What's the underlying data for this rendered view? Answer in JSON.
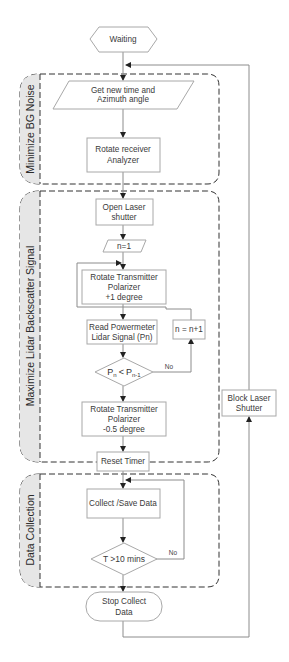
{
  "diagram": {
    "type": "flowchart",
    "colors": {
      "line": "#9a9a9a",
      "box_border": "#a8a8a8",
      "group_border": "#333333",
      "group_tab": "#e6e6e6",
      "text": "#333333"
    },
    "groups": [
      {
        "id": "bg-noise",
        "label": "Minimize BG Noise"
      },
      {
        "id": "lidar",
        "label": "Maximize Lidar Backscatter Signal"
      },
      {
        "id": "data",
        "label": "Data Collection"
      }
    ],
    "nodes": {
      "waiting": {
        "shape": "hexagon",
        "label": "Waiting"
      },
      "get_time": {
        "shape": "parallelogram",
        "line1": "Get new time and",
        "line2": "Azimuth angle"
      },
      "rotate_receiver": {
        "shape": "rectangle",
        "line1": "Rotate receiver",
        "line2": "Analyzer"
      },
      "open_laser": {
        "shape": "rectangle",
        "line1": "Open Laser",
        "line2": "shutter"
      },
      "n_init": {
        "shape": "parallelogram",
        "label": "n=1"
      },
      "rotate_tx_plus": {
        "shape": "rectangle",
        "line1": "Rotate Transmitter",
        "line2": "Polarizer",
        "line3": "+1 degree"
      },
      "read_power": {
        "shape": "rectangle",
        "line1": "Read Powermeter",
        "line2": "Lidar Signal (Pn)"
      },
      "n_increment": {
        "shape": "rectangle",
        "label": "n = n+1"
      },
      "compare": {
        "shape": "diamond",
        "p": "P",
        "sub_n": "n",
        "op": "<",
        "sub_n1": "n-1"
      },
      "rotate_tx_minus": {
        "shape": "rectangle",
        "line1": "Rotate Transmitter",
        "line2": "Polarizer",
        "line3": "-0.5 degree"
      },
      "reset_timer": {
        "shape": "rectangle",
        "label": "Reset Timer"
      },
      "collect": {
        "shape": "rectangle",
        "label": "Collect /Save Data"
      },
      "timer_check": {
        "shape": "diamond",
        "label": "T >10 mins"
      },
      "stop": {
        "shape": "terminator",
        "line1": "Stop Collect",
        "line2": "Data"
      },
      "block_laser": {
        "shape": "rectangle",
        "line1": "Block Laser",
        "line2": "Shutter"
      }
    },
    "edge_labels": {
      "compare_no": "No",
      "timer_no": "No"
    }
  }
}
